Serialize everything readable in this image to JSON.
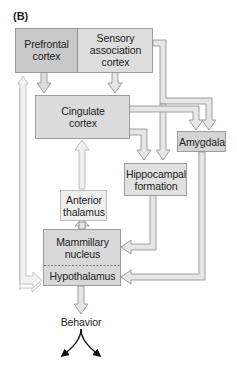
{
  "panel_label": "(B)",
  "nodes": {
    "prefrontal": "Prefrontal cortex",
    "prefrontal_l1": "Prefrontal",
    "prefrontal_l2": "cortex",
    "sensory_l1": "Sensory",
    "sensory_l2": "association",
    "sensory_l3": "cortex",
    "cingulate_l1": "Cingulate",
    "cingulate_l2": "cortex",
    "amygdala": "Amygdala",
    "hippocampal_l1": "Hippocampal",
    "hippocampal_l2": "formation",
    "anterior_l1": "Anterior",
    "anterior_l2": "thalamus",
    "mammillary_l1": "Mammillary",
    "mammillary_l2": "nucleus",
    "hypothalamus": "Hypothalamus",
    "behavior": "Behavior"
  },
  "edges": [
    {
      "from": "Prefrontal cortex",
      "to": "Cingulate cortex"
    },
    {
      "from": "Sensory association cortex",
      "to": "Cingulate cortex"
    },
    {
      "from": "Sensory association cortex",
      "to": "Amygdala"
    },
    {
      "from": "Sensory association cortex",
      "to": "Hippocampal formation"
    },
    {
      "from": "Cingulate cortex",
      "to": "Amygdala"
    },
    {
      "from": "Cingulate cortex",
      "to": "Hippocampal formation"
    },
    {
      "from": "Anterior thalamus",
      "to": "Cingulate cortex"
    },
    {
      "from": "Mammillary nucleus",
      "to": "Anterior thalamus"
    },
    {
      "from": "Hippocampal formation",
      "to": "Mammillary nucleus"
    },
    {
      "from": "Amygdala",
      "to": "Hypothalamus"
    },
    {
      "from": "Hypothalamus",
      "to": "Prefrontal cortex"
    },
    {
      "from": "Prefrontal cortex",
      "to": "Hypothalamus"
    },
    {
      "from": "Hypothalamus",
      "to": "Behavior"
    }
  ],
  "colors": {
    "dark_box": "#c9c9c9",
    "mid_box": "#dcdcdc",
    "light_box": "#ececec",
    "arrow_fill": "#e6e6e6",
    "outline": "#8a8a8a"
  }
}
